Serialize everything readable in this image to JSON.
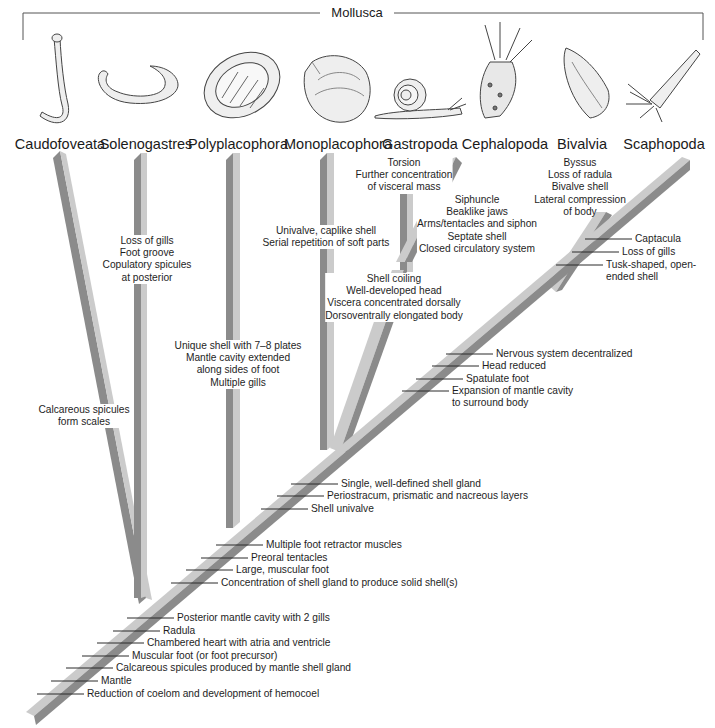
{
  "title": "Mollusca",
  "colors": {
    "branch_light": "#c9c9c9",
    "branch_dark": "#8b8b8b",
    "line": "#3a3a3a",
    "text": "#1e1e1e"
  },
  "taxa": [
    {
      "name": "Caudofoveata",
      "organism_icon": "worm-shaped-mollusc-icon"
    },
    {
      "name": "Solenogastres",
      "organism_icon": "curled-worm-mollusc-icon"
    },
    {
      "name": "Polyplacophora",
      "organism_icon": "chiton-icon"
    },
    {
      "name": "Monoplacophora",
      "organism_icon": "cap-shell-icon"
    },
    {
      "name": "Gastropoda",
      "organism_icon": "snail-icon"
    },
    {
      "name": "Cephalopoda",
      "organism_icon": "squid-icon"
    },
    {
      "name": "Bivalvia",
      "organism_icon": "clam-icon"
    },
    {
      "name": "Scaphopoda",
      "organism_icon": "tusk-shell-icon"
    }
  ],
  "branch_traits": {
    "caudofoveata": [
      "Calcareous spicules",
      "form scales"
    ],
    "solenogastres": [
      "Loss of gills",
      "Foot groove",
      "Copulatory spicules",
      "at posterior"
    ],
    "polyplacophora": [
      "Unique shell with 7–8 plates",
      "Mantle cavity extended",
      "along sides of foot",
      "Multiple gills"
    ],
    "monoplacophora": [
      "Univalve, caplike shell",
      "Serial repetition of soft parts"
    ],
    "gastropoda": [
      "Torsion",
      "Further concentration",
      "of visceral mass"
    ],
    "cephalopoda": [
      "Siphuncle",
      "Beaklike jaws",
      "Arms/tentacles and siphon",
      "Septate shell",
      "Closed circulatory system"
    ],
    "gastro_cephalo": [
      "Shell coiling",
      "Well-developed head",
      "Viscera concentrated dorsally",
      "Dorsoventrally elongated body"
    ],
    "bivalvia": [
      "Byssus",
      "Loss of radula",
      "Bivalve shell",
      "Lateral compression",
      "of body"
    ],
    "scaphopoda": [
      "Captacula",
      "Loss of gills",
      "Tusk-shaped, open-",
      "ended shell"
    ]
  },
  "trunk_traits": {
    "bivalve_scaphopod": [
      "Nervous system decentralized",
      "Head reduced",
      "Spatulate foot",
      "Expansion of mantle cavity",
      "to surround body"
    ],
    "conchifera_upper": [
      "Single, well-defined shell gland",
      "Periostracum, prismatic and nacreous layers",
      "Shell univalve"
    ],
    "testaria": [
      "Multiple foot retractor muscles",
      "Preoral tentacles",
      "Large, muscular foot",
      "Concentration of shell gland to produce solid shell(s)"
    ],
    "mollusca_base": [
      "Posterior mantle cavity with 2 gills",
      "Radula",
      "Chambered heart with atria and ventricle",
      "Muscular foot (or foot precursor)",
      "Calcareous spicules produced by mantle shell gland",
      "Mantle",
      "Reduction of coelom and development of hemocoel"
    ]
  }
}
